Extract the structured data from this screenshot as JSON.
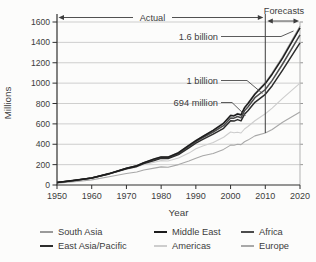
{
  "header": {
    "actual": "Actual",
    "forecasts": "Forecasts"
  },
  "axes": {
    "y_title": "Millions",
    "x_title": "Year"
  },
  "annotations": [
    {
      "label": "1.6 billion",
      "year": 2020,
      "value": 1600
    },
    {
      "label": "1 billion",
      "year": 2010,
      "value": 1000
    },
    {
      "label": "694 million",
      "year": 2003,
      "value": 694
    }
  ],
  "legend": {
    "items": [
      {
        "label": "South Asia",
        "color": "#9a9a9a"
      },
      {
        "label": "Middle East",
        "color": "#1c1c1c"
      },
      {
        "label": "Africa",
        "color": "#4c4c4c"
      },
      {
        "label": "East Asia/Pacific",
        "color": "#2d2d2d"
      },
      {
        "label": "Americas",
        "color": "#cdcdcd"
      },
      {
        "label": "Europe",
        "color": "#a8a8a8"
      }
    ]
  },
  "chart_data": {
    "type": "line",
    "title": "",
    "xlabel": "Year",
    "ylabel": "Millions",
    "xlim": [
      1950,
      2020
    ],
    "ylim": [
      0,
      1600
    ],
    "xticks": [
      1950,
      1960,
      1970,
      1980,
      1990,
      2000,
      2010,
      2020
    ],
    "yticks": [
      0,
      200,
      400,
      600,
      800,
      1000,
      1200,
      1400,
      1600
    ],
    "grid": "horizontal",
    "legend_position": "bottom",
    "stacked": true,
    "values_are_cumulative": true,
    "forecast_divider_year": 2010,
    "x": [
      1950,
      1955,
      1960,
      1965,
      1970,
      1973,
      1975,
      1978,
      1980,
      1982,
      1985,
      1988,
      1990,
      1992,
      1995,
      1998,
      2000,
      2001,
      2002,
      2003,
      2004,
      2005,
      2007,
      2010,
      2012,
      2015,
      2020
    ],
    "series": [
      {
        "name": "Europe",
        "key": "europe",
        "color": "#a8a8a8",
        "values": [
          17,
          32,
          50,
          80,
          113,
          128,
          147,
          166,
          178,
          174,
          200,
          235,
          262,
          287,
          309,
          349,
          392,
          390,
          400,
          397,
          424,
          441,
          482,
          510,
          545,
          615,
          717
        ]
      },
      {
        "name": "Americas",
        "key": "americas",
        "color": "#cdcdcd",
        "values": [
          24,
          44,
          67,
          107,
          155,
          176,
          200,
          224,
          240,
          236,
          265,
          313,
          355,
          384,
          418,
          468,
          520,
          512,
          517,
          510,
          550,
          574,
          630,
          700,
          755,
          850,
          999
        ]
      },
      {
        "name": "East Asia/Pacific",
        "key": "east-asia-pacific",
        "color": "#2d2d2d",
        "values": [
          25,
          45,
          68,
          109,
          160,
          183,
          211,
          240,
          261,
          259,
          298,
          365,
          411,
          448,
          500,
          557,
          630,
          627,
          642,
          629,
          694,
          729,
          812,
          890,
          975,
          1128,
          1396
        ]
      },
      {
        "name": "Africa",
        "key": "africa",
        "color": "#4c4c4c",
        "values": [
          25,
          45,
          68,
          111,
          162,
          186,
          216,
          247,
          268,
          267,
          308,
          378,
          426,
          464,
          520,
          582,
          658,
          656,
          672,
          660,
          728,
          766,
          857,
          937,
          1027,
          1188,
          1473
        ]
      },
      {
        "name": "Middle East",
        "key": "middle-east",
        "color": "#1c1c1c",
        "values": [
          25,
          46,
          69,
          112,
          164,
          189,
          220,
          256,
          276,
          274,
          317,
          390,
          436,
          476,
          536,
          606,
          682,
          678,
          697,
          688,
          757,
          798,
          890,
          995,
          1088,
          1246,
          1542
        ]
      },
      {
        "name": "South Asia",
        "key": "south-asia",
        "color": "#9a9a9a",
        "values": [
          25,
          46,
          69,
          113,
          166,
          190,
          222,
          258,
          278,
          277,
          320,
          394,
          439,
          480,
          540,
          611,
          687,
          684,
          703,
          694,
          764,
          806,
          900,
          1006,
          1100,
          1260,
          1561
        ]
      }
    ]
  }
}
